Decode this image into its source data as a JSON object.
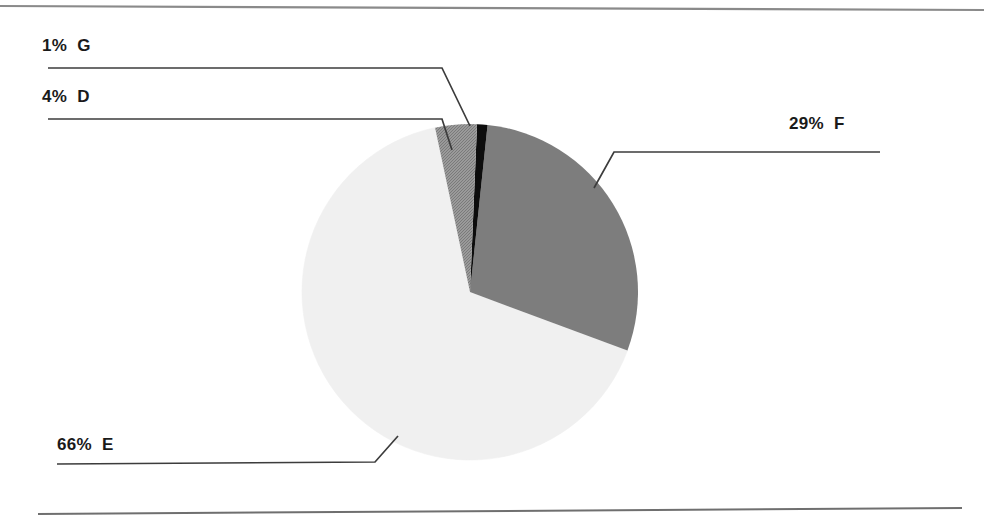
{
  "chart_data": {
    "type": "pie",
    "title": "",
    "subtitle": "",
    "xlabel": "",
    "ylabel": "",
    "legend_position": "none",
    "grid": false,
    "labels_format": "{percent}% {category}",
    "categories": [
      "D",
      "G",
      "F",
      "E"
    ],
    "values": [
      4,
      1,
      29,
      66
    ],
    "start_angle_deg": -12,
    "direction": "clockwise",
    "slices": [
      {
        "category": "D",
        "percent": 4,
        "label": "4%  D",
        "percent_text": "4%",
        "color": "#8e8e8e",
        "fill_style": "dithered-gray"
      },
      {
        "category": "G",
        "percent": 1,
        "label": "1%  G",
        "percent_text": "1%",
        "color": "#0d0d0d",
        "fill_style": "solid-black"
      },
      {
        "category": "F",
        "percent": 29,
        "label": "29%  F",
        "percent_text": "29%",
        "color": "#7d7d7d",
        "fill_style": "solid-gray"
      },
      {
        "category": "E",
        "percent": 66,
        "label": "66%  E",
        "percent_text": "66%",
        "color": "#f0f0f0",
        "fill_style": "solid-light-gray"
      }
    ]
  },
  "labels": {
    "g": "1%  G",
    "d": "4%  D",
    "f": "29%  F",
    "e": "66%  E"
  },
  "colors": {
    "slice_d": "#8e8e8e",
    "slice_g": "#0d0d0d",
    "slice_f": "#7d7d7d",
    "slice_e": "#f0f0f0",
    "leader_line": "#3c3c3c",
    "rule": "#8a8a8a",
    "text": "#1a1a1a",
    "background": "#ffffff"
  },
  "rules": {
    "top": "horizontal-rule-top",
    "bottom": "horizontal-rule-bottom"
  }
}
